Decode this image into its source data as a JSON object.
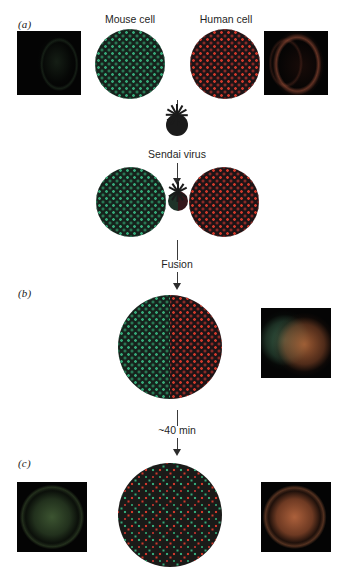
{
  "figure": {
    "background_color": "#ffffff"
  },
  "panels": [
    {
      "id": "a",
      "label": "(a)"
    },
    {
      "id": "b",
      "label": "(b)"
    },
    {
      "id": "c",
      "label": "(c)"
    }
  ],
  "labels": {
    "mouse_cell": "Mouse cell",
    "human_cell": "Human cell",
    "sendai_virus": "Sendai virus",
    "fusion": "Fusion",
    "time_elapsed": "~40 min"
  },
  "colors": {
    "mouse_marker_green": "#2f9e6e",
    "human_marker_red": "#c0392b",
    "cell_body_dark": "#16221c",
    "cell_body_dark_red": "#1d1416",
    "virus_body": "#1b1b1b",
    "arrow": "#3a3a3a",
    "text": "#1f1f1f",
    "micrograph_background": "#050505",
    "micrograph_green_glow": "#4e7a43",
    "micrograph_red_glow": "#b35c37"
  },
  "diagrams": {
    "mouse_cell": {
      "name": "mouse-cell-diagram",
      "marker_color_name": "green",
      "description": "Dark cell with evenly spaced green membrane protein markers"
    },
    "human_cell": {
      "name": "human-cell-diagram",
      "marker_color_name": "red",
      "description": "Dark cell with evenly spaced red membrane protein markers"
    },
    "fusing_pair": {
      "name": "fusing-cell-pair-diagram",
      "description": "Mouse and human cells joined by Sendai virus particle"
    },
    "heterokaryon_fresh": {
      "name": "heterokaryon-unmixed-diagram",
      "description": "Fused cell with green markers on left half and red markers on right half"
    },
    "heterokaryon_mixed": {
      "name": "heterokaryon-mixed-diagram",
      "description": "Fused cell with green and red markers fully intermixed"
    }
  },
  "micrographs": [
    {
      "id": "mouse-before",
      "name": "micrograph-mouse-antigen-before",
      "panel": "a",
      "signal": "green",
      "description": "Dark field with very faint green cell outline"
    },
    {
      "id": "human-before",
      "name": "micrograph-human-antigen-before",
      "panel": "a",
      "signal": "red",
      "description": "Dark field with faint red crescent of labelled membrane"
    },
    {
      "id": "fused-immediate",
      "name": "micrograph-heterokaryon-immediate",
      "panel": "b",
      "signal": "green-and-red",
      "description": "Fused cell with green fluorescence on one side and red on the other"
    },
    {
      "id": "fused-green-40min",
      "name": "micrograph-heterokaryon-green-40min",
      "panel": "c",
      "signal": "green",
      "description": "Green fluorescence distributed over the whole fused cell"
    },
    {
      "id": "fused-red-40min",
      "name": "micrograph-heterokaryon-red-40min",
      "panel": "c",
      "signal": "red",
      "description": "Red fluorescence distributed over the whole fused cell"
    }
  ]
}
